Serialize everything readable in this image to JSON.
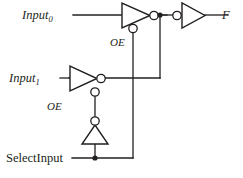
{
  "diagram": {
    "background_color": "#ffffff",
    "line_color": "#231f20",
    "labels": {
      "input0": "Input",
      "input0_sub": "0",
      "input1": "Input",
      "input1_sub": "1",
      "select": "SelectInput",
      "output": "F",
      "oe_top": "OE",
      "oe_mid": "OE"
    },
    "components": [
      {
        "id": "tristate-inverter-top",
        "type": "tristate-inverter",
        "label": "OE",
        "input": "Input0",
        "enable": "SelectInput",
        "orientation": "right"
      },
      {
        "id": "tristate-inverter-mid",
        "type": "tristate-inverter",
        "label": "OE",
        "input": "Input1",
        "enable": "SelectInput (inverted)",
        "orientation": "right"
      },
      {
        "id": "inverter-select",
        "type": "inverter",
        "input": "SelectInput",
        "orientation": "up"
      },
      {
        "id": "inverter-output",
        "type": "inverter",
        "output": "F",
        "orientation": "right",
        "bubble_side": "input"
      }
    ],
    "junctions": [
      {
        "id": "node-output",
        "x": 160,
        "y": 15
      },
      {
        "id": "node-select",
        "x": 95,
        "y": 158
      }
    ]
  }
}
